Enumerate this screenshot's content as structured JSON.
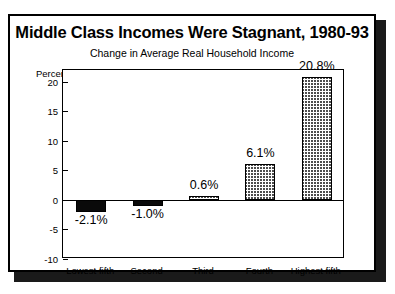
{
  "chart_data": {
    "type": "bar",
    "title": "Middle Class Incomes Were Stagnant, 1980-93",
    "subtitle": "Change in Average Real Household Income",
    "ylabel": "Percent",
    "xlabel": "",
    "categories": [
      "Lowest fifth",
      "Second",
      "Third",
      "Fourth",
      "Highest fifth"
    ],
    "values": [
      -2.1,
      -1.0,
      0.6,
      6.1,
      20.8
    ],
    "data_labels": [
      "-2.1%",
      "-1.0%",
      "0.6%",
      "6.1%",
      "20.8%"
    ],
    "ylim": [
      -10,
      22
    ],
    "yticks": [
      20,
      15,
      10,
      5,
      0,
      -5,
      -10
    ],
    "ytick_labels": [
      "20",
      "15",
      "10",
      "5",
      "0",
      "-5",
      "-10"
    ],
    "grid": false,
    "legend": "none",
    "bar_styles": [
      "solid-black",
      "solid-black",
      "gray-hatch",
      "gray-hatch",
      "gray-hatch"
    ],
    "colors": {
      "negative_bar": "#0a0a0a",
      "positive_bar_hatch": "#4d4d4d",
      "axis": "#000000",
      "background": "#ffffff"
    }
  }
}
